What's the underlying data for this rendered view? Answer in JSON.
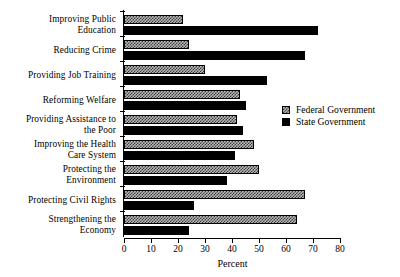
{
  "chart_data": {
    "type": "bar",
    "orientation": "horizontal",
    "title": "",
    "subtitle": "",
    "xlabel": "Percent",
    "ylabel": "",
    "xlim": [
      0,
      80
    ],
    "xticks": [
      0,
      10,
      20,
      30,
      40,
      50,
      60,
      70,
      80
    ],
    "xticklabels": [
      "0",
      "10",
      "20",
      "30",
      "40",
      "50",
      "60",
      "70",
      "80"
    ],
    "grid": false,
    "legend_position": "center-right",
    "categories": [
      "Improving Public Education",
      "Reducing Crime",
      "Providing Job Training",
      "Reforming Welfare",
      "Providing Assistance to the Poor",
      "Improving the Health Care System",
      "Protecting the Environment",
      "Protecting Civil Rights",
      "Strengthening the Economy"
    ],
    "category_lines": [
      [
        "Improving Public",
        "Education"
      ],
      [
        "Reducing Crime"
      ],
      [
        "Providing Job Training"
      ],
      [
        "Reforming Welfare"
      ],
      [
        "Providing Assistance to",
        "the Poor"
      ],
      [
        "Improving the Health",
        "Care System"
      ],
      [
        "Protecting the",
        "Environment"
      ],
      [
        "Protecting Civil Rights"
      ],
      [
        "Strengthening the",
        "Economy"
      ]
    ],
    "series": [
      {
        "name": "Federal Government",
        "color": "#b8b8b8",
        "pattern": "checker",
        "values": [
          22,
          24,
          30,
          43,
          42,
          48,
          50,
          67,
          64
        ]
      },
      {
        "name": "State Government",
        "color": "#000000",
        "pattern": "solid",
        "values": [
          72,
          67,
          53,
          45,
          44,
          41,
          38,
          26,
          24
        ]
      }
    ]
  },
  "legend": {
    "entries": [
      {
        "label": "Federal Government",
        "swatch": "federal"
      },
      {
        "label": "State Government",
        "swatch": "state"
      }
    ]
  },
  "axis": {
    "x_title": "Percent"
  }
}
